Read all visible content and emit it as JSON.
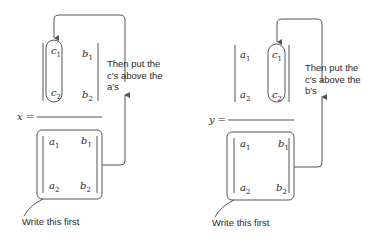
{
  "left_panel": {
    "variable_label": "x =",
    "top_matrix": {
      "col1": [
        "c1",
        "c2"
      ],
      "col2": [
        "b1",
        "b2"
      ],
      "col1_html": [
        "c<sub>1</sub>",
        "c<sub>2</sub>"
      ],
      "col2_html": [
        "b<sub>1</sub>",
        "b<sub>2</sub>"
      ]
    },
    "bottom_matrix": {
      "col1_html": [
        "a<sub>1</sub>",
        "a<sub>2</sub>"
      ],
      "col2_html": [
        "b<sub>1</sub>",
        "b<sub>2</sub>"
      ]
    },
    "instruction_lines": [
      "Then put the",
      "c′s above the",
      "a′s"
    ],
    "first_note": "Write this first"
  },
  "right_panel": {
    "variable_label": "y =",
    "top_matrix": {
      "col1_html": [
        "a<sub>1</sub>",
        "a<sub>2</sub>"
      ],
      "col2_html": [
        "c<sub>1</sub>",
        "c<sub>2</sub>"
      ]
    },
    "bottom_matrix": {
      "col1_html": [
        "a<sub>1</sub>",
        "a<sub>2</sub>"
      ],
      "col2_html": [
        "b<sub>1</sub>",
        "b<sub>2</sub>"
      ]
    },
    "instruction_lines": [
      "Then put the",
      "c′s above the",
      "b′s"
    ],
    "first_note": "Write this first"
  }
}
